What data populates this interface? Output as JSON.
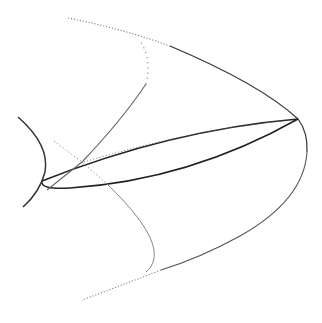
{
  "figure": {
    "background": "#ffffff",
    "stroke_dark": "#222222",
    "stroke_gray": "#777777",
    "stroke_light": "#999999",
    "curves": [
      {
        "id": "outer-parabola",
        "style": "solid-to-dotted",
        "points": [
          [
            68,
            18
          ],
          [
            161,
            42
          ],
          [
            298,
            119
          ],
          [
            307,
            150
          ],
          [
            161,
            270
          ],
          [
            82,
            300
          ]
        ]
      },
      {
        "id": "tilted-ellipse",
        "style": "solid",
        "left_vertex": [
          42,
          181
        ],
        "right_vertex": [
          298,
          119
        ]
      },
      {
        "id": "left-arc",
        "style": "solid",
        "points": [
          [
            18,
            117
          ],
          [
            46,
            165
          ],
          [
            23,
            207
          ]
        ]
      },
      {
        "id": "inner-rising-curve",
        "style": "solid-to-dotted",
        "points": [
          [
            47,
            190
          ],
          [
            82,
            162
          ],
          [
            149,
            72
          ],
          [
            141,
            42
          ]
        ]
      },
      {
        "id": "inner-descending-curve",
        "style": "dotted-to-solid",
        "points": [
          [
            54,
            141
          ],
          [
            82,
            162
          ],
          [
            106,
            183
          ],
          [
            154,
            250
          ],
          [
            146,
            272
          ]
        ]
      }
    ]
  }
}
